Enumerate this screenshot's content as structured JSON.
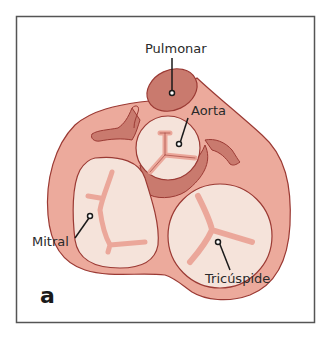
{
  "figure": {
    "panel_letter": "a",
    "labels": {
      "pulmonary": "Pulmonar",
      "aorta": "Aorta",
      "mitral": "Mitral",
      "tricuspid": "Tricúspide"
    }
  },
  "colors": {
    "frame": "#555555",
    "outer_tissue": "#ecaa9c",
    "outline": "#9b3a34",
    "valve_fill": "#f5e3da",
    "dark_tissue": "#c97a6e",
    "leaflet": "#eba79a"
  }
}
